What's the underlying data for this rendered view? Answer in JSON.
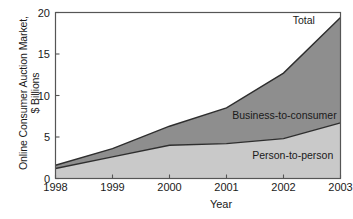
{
  "chart_data": {
    "type": "area",
    "title": "",
    "xlabel": "Year",
    "ylabel_line1": "Online Consumer Auction Market,",
    "ylabel_line2": "$ Billions",
    "categories": [
      "1998",
      "1999",
      "2000",
      "2001",
      "2002",
      "2003"
    ],
    "x": [
      1998,
      1999,
      2000,
      2001,
      2002,
      2003
    ],
    "xlim": [
      1998,
      2003
    ],
    "ylim": [
      0,
      20
    ],
    "yticks": [
      0,
      5,
      10,
      15,
      20
    ],
    "xticks": [
      1998,
      1999,
      2000,
      2001,
      2002,
      2003
    ],
    "grid": false,
    "legend_position": "inline-annotations",
    "stacked": true,
    "series": [
      {
        "name": "Person-to-person",
        "values": [
          1.2,
          2.6,
          4.0,
          4.2,
          4.8,
          6.7
        ],
        "color": "#c9c9c9"
      },
      {
        "name": "Business-to-consumer",
        "values": [
          0.4,
          1.0,
          2.3,
          4.3,
          7.9,
          12.7
        ],
        "color": "#8e8e8e"
      }
    ],
    "total": {
      "name": "Total",
      "values": [
        1.6,
        3.6,
        6.3,
        8.5,
        12.7,
        19.4
      ]
    },
    "annotations": [
      {
        "text": "Total",
        "x": 2002.55,
        "y": 18.6
      },
      {
        "text": "Business-to-consumer",
        "x": 2001.1,
        "y": 7.2
      },
      {
        "text": "Person-to-person",
        "x": 2001.45,
        "y": 2.4
      }
    ],
    "tick_labels": {
      "y": [
        "0",
        "5",
        "10",
        "15",
        "20"
      ],
      "x": [
        "1998",
        "1999",
        "2000",
        "2001",
        "2002",
        "2003"
      ]
    },
    "colors": {
      "person_to_person": "#c9c9c9",
      "business_to_consumer": "#8e8e8e",
      "line": "#2e2e2e",
      "axis": "#555555",
      "background": "#ffffff",
      "text": "#1a1a1a"
    }
  }
}
